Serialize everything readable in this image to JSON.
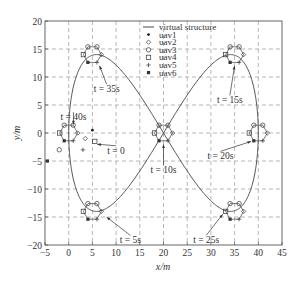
{
  "chart_data": {
    "type": "line",
    "title": "",
    "xlabel": "x/m",
    "ylabel": "y/m",
    "xlim": [
      -5,
      45
    ],
    "ylim": [
      -20,
      20
    ],
    "xticks": [
      -5,
      0,
      5,
      10,
      15,
      20,
      25,
      30,
      35,
      40,
      45
    ],
    "yticks": [
      -20,
      -15,
      -10,
      -5,
      0,
      5,
      10,
      15,
      20
    ],
    "grid": true,
    "legend_position": "upper center",
    "legend": [
      {
        "name": "virtual structure",
        "marker": "line"
      },
      {
        "name": "uav1",
        "marker": "star"
      },
      {
        "name": "uav2",
        "marker": "diamond"
      },
      {
        "name": "uav3",
        "marker": "circle"
      },
      {
        "name": "uav4",
        "marker": "square"
      },
      {
        "name": "uav5",
        "marker": "plus"
      },
      {
        "name": "uav6",
        "marker": "asterisk-square"
      }
    ],
    "series": [
      {
        "name": "virtual structure",
        "description": "figure-eight (lemniscate) trajectory centered at (20,0), x from 0 to 40, y from -14 to 14",
        "x": [
          0,
          1,
          2,
          4,
          6,
          8,
          10,
          12,
          14,
          16,
          18,
          20,
          22,
          24,
          26,
          28,
          30,
          32,
          34,
          36,
          38,
          39,
          40
        ],
        "y_upper": [
          0,
          6,
          10,
          13.5,
          14,
          13.2,
          11.5,
          9,
          6.5,
          4,
          2,
          0,
          -2,
          -4,
          -6.5,
          -9,
          -11.5,
          -13.2,
          -14,
          -13.5,
          -10,
          -6,
          0
        ]
      }
    ],
    "formations": [
      {
        "time": "t = 0",
        "center": [
          5,
          -1.5
        ],
        "note": "initial scattered positions"
      },
      {
        "time": "t = 5s",
        "center": [
          5,
          -14
        ]
      },
      {
        "time": "t = 10s",
        "center": [
          20,
          0
        ]
      },
      {
        "time": "t = 15s",
        "center": [
          35,
          14
        ]
      },
      {
        "time": "t = 20s",
        "center": [
          40,
          0
        ]
      },
      {
        "time": "t = 25s",
        "center": [
          35,
          -14
        ]
      },
      {
        "time": "t = 35s",
        "center": [
          5,
          14
        ]
      },
      {
        "time": "t = 40s",
        "center": [
          0,
          0
        ]
      }
    ],
    "initial_positions": [
      {
        "uav": "uav1",
        "x": 5,
        "y": 0.5
      },
      {
        "uav": "uav2",
        "x": 3.5,
        "y": -1
      },
      {
        "uav": "uav3",
        "x": -2,
        "y": -3
      },
      {
        "uav": "uav4",
        "x": 5.5,
        "y": -1.5
      },
      {
        "uav": "uav5",
        "x": 3,
        "y": -3
      },
      {
        "uav": "uav6",
        "x": -4.5,
        "y": -5
      }
    ],
    "annotations": [
      {
        "text": "t = 0",
        "x": 10,
        "y": -3
      },
      {
        "text": "t = 5s",
        "x": 13,
        "y": -19
      },
      {
        "text": "t = 10s",
        "x": 20,
        "y": -6.5
      },
      {
        "text": "t = 15s",
        "x": 34,
        "y": 6
      },
      {
        "text": "t = 20s",
        "x": 32,
        "y": -4
      },
      {
        "text": "t = 25s",
        "x": 29,
        "y": -19
      },
      {
        "text": "t = 35s",
        "x": 8,
        "y": 8
      },
      {
        "text": "t = 40s",
        "x": 1,
        "y": 3
      }
    ]
  },
  "labels": {
    "xlabel": "x/m",
    "ylabel": "y/m",
    "legend": [
      "virtual structure",
      "uav1",
      "uav2",
      "uav3",
      "uav4",
      "uav5",
      "uav6"
    ],
    "annotations": [
      "t = 0",
      "t = 5s",
      "t = 10s",
      "t = 15s",
      "t = 20s",
      "t = 25s",
      "t = 35s",
      "t = 40s"
    ],
    "xticks": [
      "−5",
      "0",
      "5",
      "10",
      "15",
      "20",
      "25",
      "30",
      "35",
      "40",
      "45"
    ],
    "yticks": [
      "20",
      "15",
      "10",
      "5",
      "0",
      "−5",
      "−10",
      "−15",
      "−20"
    ]
  }
}
